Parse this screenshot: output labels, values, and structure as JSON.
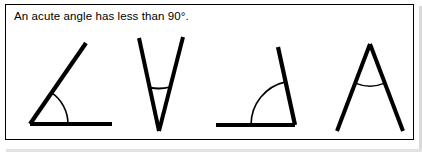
{
  "page": {
    "background_color": "#ffffff",
    "width": 422,
    "height": 152
  },
  "frame": {
    "border_color": "#000000",
    "fill_color": "#ffffff"
  },
  "caption": {
    "text": "An acute angle has less than 90°."
  },
  "figures": {
    "stroke_color": "#000000",
    "arc_color": "#000000",
    "items": [
      {
        "name": "acute-angle-open-right",
        "description": "Angle with horizontal ray to the right and an upward-right slanting ray, arc marking the interior angle",
        "vertex": [
          30,
          124
        ],
        "ray_a_end": [
          112,
          124
        ],
        "ray_b_end": [
          86,
          43
        ],
        "stroke_width": 4.2,
        "arc_radius": 38,
        "arc_stroke_width": 1.6
      },
      {
        "name": "acute-angle-v-shape",
        "description": "Narrow V shape opening upward with a short straight chord marking the angle near the vertex",
        "vertex": [
          159,
          131
        ],
        "ray_a_end": [
          139,
          38
        ],
        "ray_b_end": [
          183,
          37
        ],
        "stroke_width": 4.0,
        "arc_radius": 44,
        "arc_stroke_width": 1.8
      },
      {
        "name": "acute-angle-open-left",
        "description": "Angle with horizontal ray to the left and a near-vertical ray tilting left, arc marking the interior angle",
        "vertex": [
          295,
          125
        ],
        "ray_a_end": [
          216,
          125
        ],
        "ray_b_end": [
          278,
          47
        ],
        "stroke_width": 4.2,
        "arc_radius": 44,
        "arc_stroke_width": 1.6
      },
      {
        "name": "acute-angle-inverted-v",
        "description": "Inverted V (lambda) shape with apex at the top and a thin arc chord just below the apex",
        "vertex": [
          370,
          44
        ],
        "ray_a_end": [
          337,
          131
        ],
        "ray_b_end": [
          403,
          131
        ],
        "stroke_width": 4.0,
        "arc_radius": 40,
        "arc_stroke_width": 1.4
      }
    ]
  }
}
